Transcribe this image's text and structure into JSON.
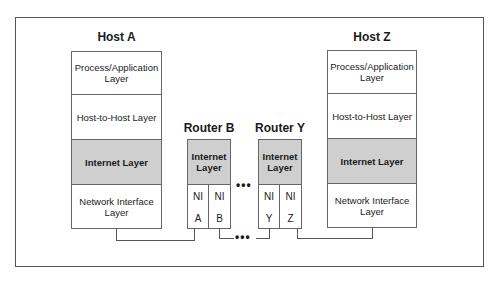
{
  "diagram": {
    "hosts": [
      {
        "name": "Host A",
        "layers": [
          "Process/Application Layer",
          "Host-to-Host Layer",
          "Internet Layer",
          "Network Interface Layer"
        ]
      },
      {
        "name": "Host Z",
        "layers": [
          "Process/Application Layer",
          "Host-to-Host Layer",
          "Internet Layer",
          "Network Interface Layer"
        ]
      }
    ],
    "routers": [
      {
        "name": "Router B",
        "layer": "Internet Layer",
        "interfaces": [
          {
            "top": "NI",
            "bottom": "A"
          },
          {
            "top": "NI",
            "bottom": "B"
          }
        ]
      },
      {
        "name": "Router Y",
        "layer": "Internet Layer",
        "interfaces": [
          {
            "top": "NI",
            "bottom": "Y"
          },
          {
            "top": "NI",
            "bottom": "Z"
          }
        ]
      }
    ],
    "ellipsis": "•••",
    "colors": {
      "highlight_layer": "#cfcfcf",
      "border": "#666666"
    }
  }
}
